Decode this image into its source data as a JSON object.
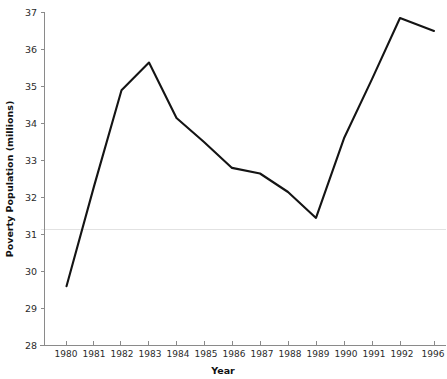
{
  "chart_data": {
    "type": "line",
    "title": "",
    "xlabel": "Year",
    "ylabel": "Poverty Population (millions)",
    "categories": [
      "1980",
      "1981",
      "1982",
      "1983",
      "1984",
      "1985",
      "1986",
      "1987",
      "1988",
      "1989",
      "1990",
      "1991",
      "1992",
      "1996"
    ],
    "values": [
      29.6,
      32.3,
      34.9,
      35.65,
      34.15,
      33.5,
      32.8,
      32.65,
      32.15,
      31.45,
      33.6,
      35.2,
      36.85,
      36.5
    ],
    "series": [
      {
        "name": "Poverty Population",
        "values": [
          29.6,
          32.3,
          34.9,
          35.65,
          34.15,
          33.5,
          32.8,
          32.65,
          32.15,
          31.45,
          33.6,
          35.2,
          36.85,
          36.5
        ]
      }
    ],
    "ylim": [
      28,
      37
    ],
    "yticks": [
      28,
      29,
      30,
      31,
      32,
      33,
      34,
      35,
      36,
      37
    ],
    "ytick_labels": [
      "28",
      "29",
      "30",
      "31",
      "32",
      "33",
      "34",
      "35",
      "36",
      "37"
    ],
    "xtick_labels": [
      "1980",
      "1981",
      "1982",
      "1983",
      "1984",
      "1985",
      "1986",
      "1987",
      "1988",
      "1989",
      "1990",
      "1991",
      "1992",
      "1996"
    ],
    "grid": "horizontal-single-at-31",
    "gridlines": [
      31
    ],
    "legend": "none",
    "line_color": "#141414",
    "grid_color": "#e2e2e2",
    "axis_color": "#8a8a8a",
    "note": "Vertex-only years (1981, 1985, 1991) are interpolated along straight segments; 1996 follows a 4-year gap rendered as one equal x step."
  },
  "axes": {
    "y_title": "Poverty Population (millions)",
    "x_title": "Year"
  }
}
